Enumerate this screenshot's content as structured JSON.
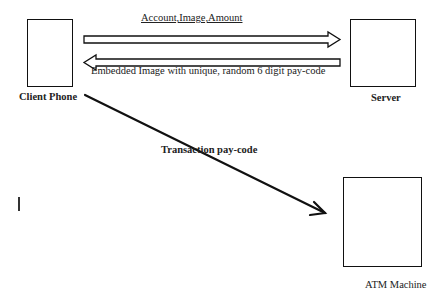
{
  "nodes": {
    "client_phone": {
      "label": "Client Phone"
    },
    "server": {
      "label": "Server"
    },
    "atm": {
      "label": "ATM Machine"
    }
  },
  "edges": {
    "client_to_server": {
      "label": "Account,Image,Amount"
    },
    "server_to_client": {
      "label": "Embedded Image with unique, random 6 digit pay-code"
    },
    "client_to_atm": {
      "label": "Transaction pay-code"
    }
  },
  "colors": {
    "stroke": "#111111",
    "background": "#ffffff"
  }
}
